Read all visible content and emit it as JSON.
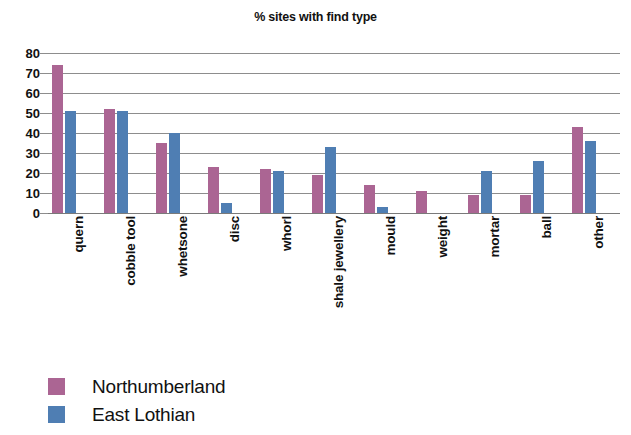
{
  "chart_data": {
    "type": "bar",
    "title": "% sites with find type",
    "xlabel": "",
    "ylabel": "",
    "ylim": [
      0,
      80
    ],
    "ytick_step": 10,
    "yticks": [
      "80",
      "70",
      "60",
      "50",
      "40",
      "30",
      "20",
      "10",
      "0"
    ],
    "grid": true,
    "legend_position": "bottom-left",
    "categories": [
      "quern",
      "cobble tool",
      "whetsone",
      "disc",
      "whorl",
      "shale jewellery",
      "mould",
      "weight",
      "mortar",
      "ball",
      "other"
    ],
    "series": [
      {
        "name": "Northumberland",
        "color": "#ab6593",
        "values": [
          74,
          52,
          35,
          23,
          22,
          19,
          14,
          11,
          9,
          9,
          43
        ]
      },
      {
        "name": "East Lothian",
        "color": "#4f7eb3",
        "values": [
          51,
          51,
          40,
          5,
          21,
          33,
          3,
          0,
          21,
          26,
          36
        ]
      }
    ]
  },
  "legend": {
    "items": [
      {
        "label": "Northumberland",
        "swatch": "series-0"
      },
      {
        "label": "East Lothian",
        "swatch": "series-1"
      }
    ]
  }
}
